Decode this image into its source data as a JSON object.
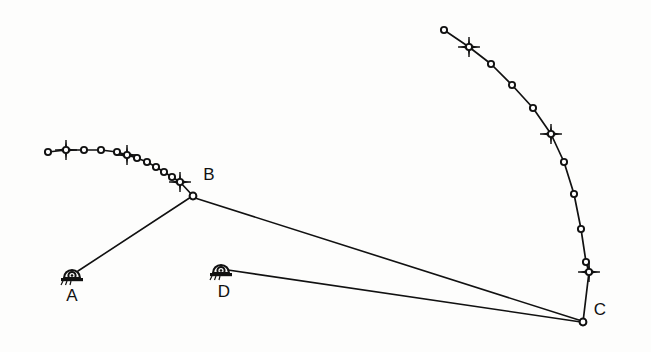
{
  "diagram": {
    "type": "engineering-survey-sketch",
    "background_color": "#fdfdfc",
    "ink_color": "#111111",
    "width": 651,
    "height": 352,
    "stations": [
      {
        "id": "A",
        "label": "A",
        "symbol": "theodolite-icon",
        "x": 72,
        "y": 275,
        "label_x": 72,
        "label_y": 301
      },
      {
        "id": "D",
        "label": "D",
        "symbol": "theodolite-icon",
        "x": 221,
        "y": 270,
        "label_x": 224,
        "label_y": 297
      },
      {
        "id": "B",
        "label": "B",
        "symbol": "node-circle",
        "x": 193,
        "y": 196,
        "label_x": 209,
        "label_y": 180
      },
      {
        "id": "C",
        "label": "C",
        "symbol": "node-circle",
        "x": 583,
        "y": 322,
        "label_x": 600,
        "label_y": 315
      }
    ],
    "sight_lines": [
      {
        "name": "line-a-b",
        "from": "A",
        "to": "B",
        "x1": 78,
        "y1": 271,
        "x2": 191,
        "y2": 197
      },
      {
        "name": "line-b-c",
        "from": "B",
        "to": "C",
        "x1": 195,
        "y1": 198,
        "x2": 582,
        "y2": 321
      },
      {
        "name": "line-d-c",
        "from": "D",
        "to": "C",
        "x1": 228,
        "y1": 270,
        "x2": 581,
        "y2": 322
      }
    ],
    "arcs": [
      {
        "name": "left-arc",
        "description": "Observation arc terminating at station B",
        "point_count": 13,
        "star_count": 3,
        "points": [
          {
            "x": 48,
            "y": 152,
            "marker": "circle"
          },
          {
            "x": 66,
            "y": 150,
            "marker": "star"
          },
          {
            "x": 84,
            "y": 150,
            "marker": "circle"
          },
          {
            "x": 101,
            "y": 150,
            "marker": "circle"
          },
          {
            "x": 117,
            "y": 152,
            "marker": "circle"
          },
          {
            "x": 127,
            "y": 155,
            "marker": "star"
          },
          {
            "x": 137,
            "y": 158,
            "marker": "circle"
          },
          {
            "x": 147,
            "y": 162,
            "marker": "circle"
          },
          {
            "x": 156,
            "y": 167,
            "marker": "circle"
          },
          {
            "x": 164,
            "y": 172,
            "marker": "circle"
          },
          {
            "x": 172,
            "y": 177,
            "marker": "circle"
          },
          {
            "x": 180,
            "y": 182,
            "marker": "star"
          },
          {
            "x": 193,
            "y": 196,
            "marker": "circle"
          }
        ]
      },
      {
        "name": "right-arc",
        "description": "Observation arc terminating at station C",
        "point_count": 12,
        "star_count": 3,
        "points": [
          {
            "x": 444,
            "y": 30,
            "marker": "circle"
          },
          {
            "x": 469,
            "y": 47,
            "marker": "star"
          },
          {
            "x": 491,
            "y": 64,
            "marker": "circle"
          },
          {
            "x": 512,
            "y": 85,
            "marker": "circle"
          },
          {
            "x": 533,
            "y": 108,
            "marker": "circle"
          },
          {
            "x": 551,
            "y": 134,
            "marker": "star"
          },
          {
            "x": 564,
            "y": 162,
            "marker": "circle"
          },
          {
            "x": 574,
            "y": 194,
            "marker": "circle"
          },
          {
            "x": 581,
            "y": 229,
            "marker": "circle"
          },
          {
            "x": 586,
            "y": 262,
            "marker": "circle"
          },
          {
            "x": 589,
            "y": 272,
            "marker": "star"
          },
          {
            "x": 583,
            "y": 322,
            "marker": "circle"
          }
        ]
      }
    ],
    "legend": {
      "circle_marker": "observation-point",
      "star_marker": "control-point",
      "theodolite_marker": "instrument-station"
    }
  }
}
